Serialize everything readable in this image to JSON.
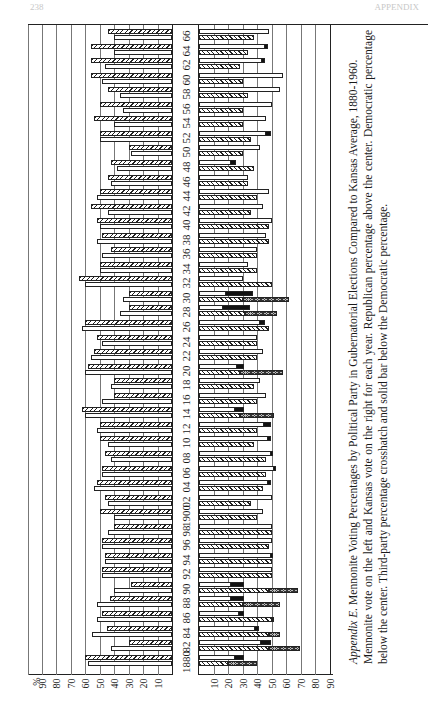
{
  "page": {
    "header_left": "238",
    "header_right": "APPENDIX"
  },
  "caption": {
    "label": "Appendix E.",
    "title": "Mennonite Voting Percentages by Political Party in Gubernatorial Elections Compared to Kansas Average, 1880-1960.",
    "body": "Mennonite vote on the left and Kansas vote on the right for each year. Republican percentage above the center. Democratic percentage below the center. Third-party percentage crosshatch and solid bar below the Democratic percentage."
  },
  "chart_data": {
    "type": "bar",
    "title": "Mennonite Voting Percentages by Political Party in Gubernatorial Elections Compared to Kansas Average, 1880-1960",
    "orientation": "rotated 90deg; years along vertical center strip, percentages along horizontal axes",
    "xlabel": "%",
    "left_panel": "Mennonite vote",
    "right_panel": "Kansas vote",
    "left_axis_ticks": [
      "%",
      "90",
      "80",
      "70",
      "60",
      "50",
      "40",
      "30",
      "20",
      "10"
    ],
    "right_axis_ticks": [
      "10",
      "20",
      "30",
      "40",
      "50",
      "60",
      "70",
      "80",
      "90"
    ],
    "xlim": [
      0,
      90
    ],
    "legend": [
      {
        "name": "Republican",
        "style": "diagonal hatch"
      },
      {
        "name": "Democratic",
        "style": "plain white"
      },
      {
        "name": "Third-party (fusion)",
        "style": "crosshatch"
      },
      {
        "name": "Third-party",
        "style": "solid black"
      }
    ],
    "categories": [
      "1880",
      "82",
      "84",
      "86",
      "88",
      "90",
      "92",
      "94",
      "96",
      "98",
      "1900",
      "02",
      "04",
      "06",
      "08",
      "10",
      "12",
      "14",
      "16",
      "18",
      "20",
      "22",
      "24",
      "26",
      "28",
      "30",
      "32",
      "34",
      "36",
      "38",
      "40",
      "42",
      "44",
      "46",
      "48",
      "50",
      "52",
      "54",
      "56",
      "58",
      "60",
      "62",
      "64",
      "66"
    ],
    "series": [
      {
        "name": "Mennonite Republican",
        "values": [
          60,
          30,
          45,
          48,
          43,
          28,
          48,
          46,
          48,
          40,
          50,
          46,
          52,
          48,
          46,
          50,
          50,
          62,
          40,
          40,
          58,
          54,
          52,
          60,
          30,
          30,
          64,
          50,
          42,
          48,
          52,
          56,
          50,
          44,
          42,
          30,
          50,
          54,
          50,
          44,
          56,
          56,
          56,
          44
        ]
      },
      {
        "name": "Mennonite Democratic",
        "values": [
          58,
          42,
          55,
          52,
          52,
          40,
          48,
          46,
          48,
          44,
          40,
          44,
          54,
          48,
          42,
          44,
          52,
          60,
          48,
          42,
          60,
          56,
          48,
          62,
          36,
          34,
          60,
          50,
          48,
          52,
          50,
          44,
          52,
          42,
          38,
          28,
          50,
          40,
          34,
          36,
          48,
          46,
          40,
          40
        ]
      },
      {
        "name": "Kansas Republican",
        "values": [
          20,
          48,
          48,
          50,
          30,
          48,
          50,
          50,
          48,
          50,
          40,
          36,
          44,
          46,
          46,
          38,
          40,
          28,
          40,
          38,
          28,
          40,
          40,
          48,
          32,
          30,
          50,
          40,
          40,
          48,
          48,
          36,
          40,
          34,
          38,
          30,
          36,
          30,
          30,
          34,
          30,
          28,
          34,
          38
        ]
      },
      {
        "name": "Kansas Democratic",
        "values": [
          30,
          48,
          40,
          30,
          30,
          30,
          50,
          50,
          50,
          50,
          44,
          50,
          48,
          52,
          50,
          48,
          48,
          30,
          46,
          42,
          30,
          44,
          40,
          44,
          34,
          36,
          30,
          34,
          40,
          46,
          50,
          44,
          48,
          34,
          24,
          42,
          48,
          46,
          50,
          56,
          58,
          44,
          46,
          48
        ]
      },
      {
        "name": "Kansas Third-party crosshatch",
        "values": [
          20,
          22,
          8,
          2,
          26,
          20,
          0,
          0,
          0,
          0,
          0,
          0,
          0,
          0,
          0,
          0,
          0,
          24,
          0,
          0,
          30,
          0,
          0,
          0,
          22,
          32,
          0,
          0,
          0,
          0,
          0,
          0,
          0,
          0,
          0,
          0,
          0,
          0,
          0,
          0,
          0,
          0,
          0,
          0
        ]
      },
      {
        "name": "Kansas Third-party solid",
        "values": [
          10,
          10,
          4,
          5,
          14,
          14,
          0,
          2,
          0,
          0,
          0,
          0,
          2,
          2,
          2,
          2,
          6,
          10,
          0,
          0,
          8,
          0,
          0,
          4,
          30,
          30,
          0,
          0,
          0,
          0,
          0,
          0,
          0,
          0,
          4,
          0,
          4,
          0,
          0,
          0,
          0,
          2,
          2,
          0
        ]
      }
    ]
  },
  "axes": {
    "left_percent_symbol": "%",
    "left_ticks": [
      "90",
      "80",
      "70",
      "60",
      "50",
      "40",
      "30",
      "20",
      "10"
    ],
    "right_ticks": [
      "10",
      "20",
      "30",
      "40",
      "50",
      "60",
      "70",
      "80",
      "90"
    ]
  }
}
